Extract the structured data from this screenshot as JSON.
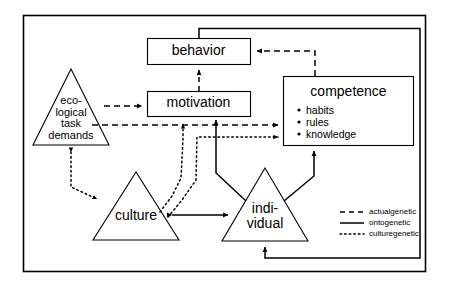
{
  "figure": {
    "type": "diagram",
    "kind": "conceptual-model-flow-diagram",
    "background_color": "#ffffff",
    "line_color": "#000000",
    "frame": {
      "label": "outer-border"
    }
  },
  "nodes": {
    "behavior": {
      "label": "behavior",
      "shape": "rectangle"
    },
    "motivation": {
      "label": "motivation",
      "shape": "rectangle"
    },
    "competence": {
      "label": "competence",
      "shape": "rectangle",
      "items": [
        "habits",
        "rules",
        "knowledge"
      ]
    },
    "ecological": {
      "label": "eco-\nlogical\ntask\ndemands",
      "shape": "triangle"
    },
    "culture": {
      "label": "culture",
      "shape": "triangle"
    },
    "individual": {
      "label": "indi-\nvidual",
      "shape": "triangle"
    }
  },
  "legend": {
    "items": [
      {
        "style": "dashed",
        "label": "actualgenetic"
      },
      {
        "style": "solid",
        "label": "ontogenetic"
      },
      {
        "style": "dotted",
        "label": "culturegenetic"
      }
    ]
  },
  "edges": [
    {
      "from": "ecological",
      "to": "motivation",
      "style": "dashed"
    },
    {
      "from": "ecological",
      "to": "competence",
      "style": "dashed"
    },
    {
      "from": "motivation",
      "to": "behavior",
      "style": "dashed"
    },
    {
      "from": "competence",
      "to": "behavior",
      "style": "dashed"
    },
    {
      "from": "culture",
      "to": "motivation",
      "style": "dotted"
    },
    {
      "from": "culture",
      "to": "competence",
      "style": "dotted"
    },
    {
      "from": "ecological",
      "to": "culture",
      "style": "dotted",
      "bidirectional": true
    },
    {
      "from": "individual",
      "to": "motivation",
      "style": "solid"
    },
    {
      "from": "individual",
      "to": "competence",
      "style": "solid"
    },
    {
      "from": "culture",
      "to": "individual",
      "style": "solid",
      "bidirectional": true
    },
    {
      "from": "behavior",
      "to": "individual",
      "style": "solid",
      "note": "feedback loop around right side"
    }
  ]
}
